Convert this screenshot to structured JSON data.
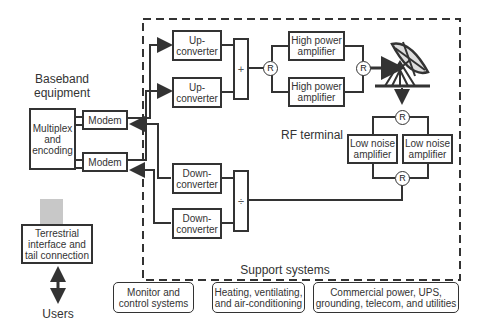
{
  "diagram": {
    "type": "satellite earth station block diagram",
    "baseband": {
      "title": "Baseband\nequipment",
      "multiplex": "Multiplex\nand\nencoding",
      "modems": [
        "Modem",
        "Modem"
      ]
    },
    "rf_terminal": {
      "title": "RF terminal",
      "up_converters": [
        "Up-\nconverter",
        "Up-\nconverter"
      ],
      "down_converters": [
        "Down-\nconverter",
        "Down-\nconverter"
      ],
      "combiner_symbol": "+",
      "divider_symbol": "÷",
      "redundancy_symbol": "R",
      "hpa": [
        "High power\namplifier",
        "High power\namplifier"
      ],
      "lna": [
        "Low noise\namplifier",
        "Low noise\namplifier"
      ],
      "antenna": "dish-antenna"
    },
    "terrestrial": "Terrestrial\ninterface and\ntail connection",
    "users": "Users",
    "support": {
      "title": "Support systems",
      "items": [
        "Monitor and\ncontrol systems",
        "Heating, ventilating,\nand air-conditioning",
        "Commercial power, UPS,\ngrounding, telecom, and utilities"
      ]
    }
  }
}
